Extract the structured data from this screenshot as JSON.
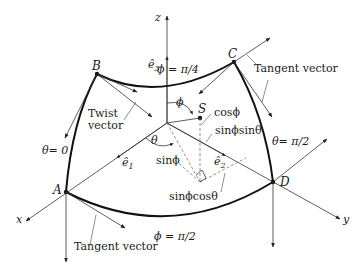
{
  "figure": {
    "axes": {
      "x_label": "x",
      "y_label": "y",
      "z_label": "z"
    },
    "unit_vectors": {
      "e1": "ê",
      "e1_sub": "1",
      "e2": "ê",
      "e2_sub": "2",
      "e3": "ê",
      "e3_sub": "3"
    },
    "points": {
      "A": "A",
      "B": "B",
      "C": "C",
      "D": "D",
      "S": "S"
    },
    "boundary_labels": {
      "phi_pi_4": "ϕ = π/4",
      "phi_pi_2": "ϕ = π/2",
      "theta_0": "θ= 0",
      "theta_pi_2": "θ= π/2"
    },
    "angle_labels": {
      "phi": "ϕ",
      "theta": "θ"
    },
    "component_labels": {
      "cos_phi": "cosϕ",
      "sin_phi_sin_theta": "sinϕsinθ",
      "sin_phi": "sinϕ",
      "sin_phi_cos_theta": "sinϕcosθ"
    },
    "annotations": {
      "twist_vector_line1": "Twist",
      "twist_vector_line2": "vector",
      "tangent_vector_top": "Tangent vector",
      "tangent_vector_bottom": "Tangent vector"
    }
  }
}
